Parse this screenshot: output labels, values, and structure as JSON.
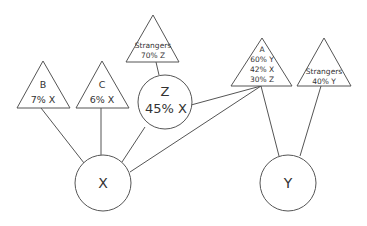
{
  "diagram": {
    "type": "network",
    "line_color": "#555555",
    "nodes": {
      "X": {
        "shape": "circle",
        "label": "X"
      },
      "Y": {
        "shape": "circle",
        "label": "Y"
      },
      "Z": {
        "shape": "circle",
        "label": "Z",
        "value": "45% X"
      },
      "B": {
        "shape": "triangle",
        "label": "B",
        "value": "7% X"
      },
      "C": {
        "shape": "triangle",
        "label": "C",
        "value": "6% X"
      },
      "strangers_z": {
        "shape": "triangle",
        "label": "Strangers",
        "value": "70% Z"
      },
      "A": {
        "shape": "triangle",
        "label": "A",
        "values": [
          "60% Y",
          "42% X",
          "30% Z"
        ]
      },
      "strangers_y": {
        "shape": "triangle",
        "label": "Strangers",
        "value": "40% Y"
      }
    },
    "edges": [
      [
        "B",
        "X"
      ],
      [
        "C",
        "X"
      ],
      [
        "Z",
        "X"
      ],
      [
        "A",
        "X"
      ],
      [
        "strangers_z",
        "Z"
      ],
      [
        "A",
        "Z"
      ],
      [
        "A",
        "Y"
      ],
      [
        "strangers_y",
        "Y"
      ]
    ]
  }
}
